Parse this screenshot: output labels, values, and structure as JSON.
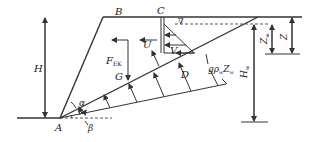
{
  "diagram": {
    "points": {
      "A": "A",
      "B": "B",
      "C": "C"
    },
    "forces": {
      "F_EK": "F",
      "F_EK_sub": "EK",
      "U": "U",
      "V": "V",
      "G": "G",
      "D": "D"
    },
    "dimensions": {
      "H": "H",
      "Z": "Z",
      "Zw": "Z",
      "Zw_sub": "w",
      "Hw": "H",
      "Hw_sub": "w"
    },
    "angles": {
      "alpha": "α",
      "beta": "β"
    },
    "pressure_label": {
      "g": "g",
      "rho": "ρ",
      "rho_sub": "w",
      "Z": "Z",
      "Z_sub": "w"
    },
    "water_table_symbol": "∇"
  }
}
